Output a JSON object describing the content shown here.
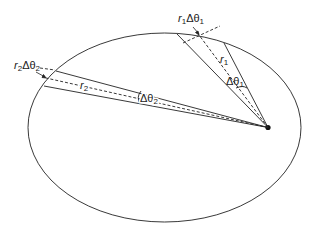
{
  "diagram": {
    "type": "kepler-second-law-orbit",
    "labels": {
      "arc1": {
        "base": "r",
        "sub1": "1",
        "mid": "Δθ",
        "sub2": "1"
      },
      "arc2": {
        "base": "r",
        "sub1": "2",
        "mid": "Δθ",
        "sub2": "2"
      },
      "radius1": {
        "base": "r",
        "sub": "1"
      },
      "radius2": {
        "base": "r",
        "sub": "2"
      },
      "angle1": {
        "base": "Δθ",
        "sub": "1"
      },
      "angle2": {
        "base": "Δθ",
        "sub": "2"
      }
    },
    "colors": {
      "stroke": "#222222",
      "background": "#ffffff"
    }
  }
}
